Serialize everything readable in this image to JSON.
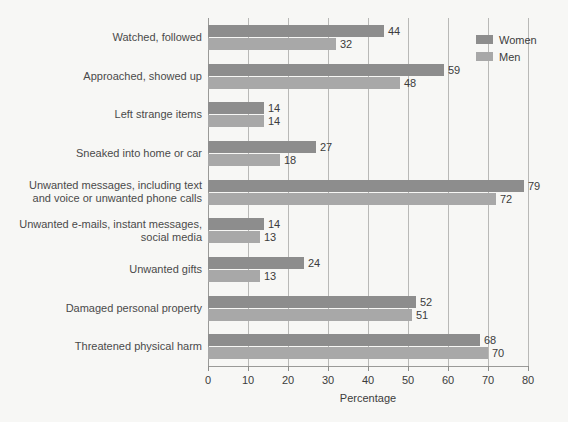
{
  "chart_data": {
    "type": "bar",
    "orientation": "horizontal",
    "title": "",
    "xlabel": "Percentage",
    "ylabel": "",
    "xlim": [
      0,
      80
    ],
    "xticks": [
      0,
      10,
      20,
      30,
      40,
      50,
      60,
      70,
      80
    ],
    "grid": true,
    "legend_position": "top-right",
    "categories": [
      "Watched, followed",
      "Approached, showed up",
      "Left strange items",
      "Sneaked into home or car",
      "Unwanted messages, including text and voice or unwanted phone calls",
      "Unwanted e-mails, instant messages, social media",
      "Unwanted gifts",
      "Damaged personal property",
      "Threatened physical harm"
    ],
    "category_lines": [
      [
        "Watched, followed"
      ],
      [
        "Approached, showed up"
      ],
      [
        "Left strange items"
      ],
      [
        "Sneaked into home or car"
      ],
      [
        "Unwanted messages, including text",
        "and voice or unwanted phone calls"
      ],
      [
        "Unwanted e-mails, instant messages,",
        "social media"
      ],
      [
        "Unwanted gifts"
      ],
      [
        "Damaged personal property"
      ],
      [
        "Threatened physical harm"
      ]
    ],
    "series": [
      {
        "name": "Women",
        "color": "#8d8d8d",
        "values": [
          44,
          59,
          14,
          27,
          79,
          14,
          24,
          52,
          68
        ]
      },
      {
        "name": "Men",
        "color": "#a8a8a8",
        "values": [
          32,
          48,
          14,
          18,
          72,
          13,
          13,
          51,
          70
        ]
      }
    ]
  },
  "legend": {
    "items": [
      {
        "label": "Women",
        "color": "#8d8d8d"
      },
      {
        "label": "Men",
        "color": "#a8a8a8"
      }
    ]
  },
  "axis": {
    "x_title": "Percentage",
    "x_tick_labels": [
      "0",
      "10",
      "20",
      "30",
      "40",
      "50",
      "60",
      "70",
      "80"
    ]
  },
  "colors": {
    "background": "#f7f7f5",
    "women_bar": "#8d8d8d",
    "men_bar": "#a8a8a8",
    "gridline": "#b9b9b7",
    "axis": "#9a9a98",
    "label_text": "#4a4a4a",
    "value_text": "#3c3c3c"
  }
}
